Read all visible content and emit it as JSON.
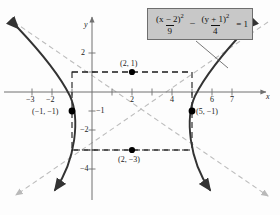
{
  "figure": {
    "background": "#fdfdfd"
  },
  "equation": {
    "numerator_x": "(x − 2)²",
    "denominator_x": "9",
    "operator": "−",
    "numerator_y": "(y + 1)²",
    "denominator_y": "4",
    "rhs": "= 1",
    "box_fill": "#c8c8c8",
    "box_border": "#6e6e6e"
  },
  "axes": {
    "x_label": "x",
    "y_label": "y",
    "x_ticks": [
      {
        "value": -3,
        "label": "−3"
      },
      {
        "value": -2,
        "label": "−2"
      },
      {
        "value": -1,
        "label": ""
      },
      {
        "value": 1,
        "label": ""
      },
      {
        "value": 2,
        "label": "2"
      },
      {
        "value": 3,
        "label": ""
      },
      {
        "value": 4,
        "label": "4"
      },
      {
        "value": 5,
        "label": ""
      },
      {
        "value": 6,
        "label": "6"
      },
      {
        "value": 7,
        "label": "7"
      }
    ],
    "y_ticks": [
      {
        "value": 2,
        "label": "2"
      },
      {
        "value": 1,
        "label": ""
      },
      {
        "value": -1,
        "label": "−1"
      },
      {
        "value": -2,
        "label": "−2"
      },
      {
        "value": -3,
        "label": ""
      },
      {
        "value": -4,
        "label": "−4"
      }
    ],
    "x_range": [
      -4,
      8
    ],
    "y_range": [
      -5,
      3
    ]
  },
  "points": [
    {
      "name": "top-co-vertex",
      "label": "(2, 1)",
      "x": 2,
      "y": 1
    },
    {
      "name": "left-vertex",
      "label": "(−1, −1)",
      "x": -1,
      "y": -1
    },
    {
      "name": "right-vertex",
      "label": "(5, −1)",
      "x": 5,
      "y": -1
    },
    {
      "name": "bottom-co-vertex",
      "label": "(2, −3)",
      "x": 2,
      "y": -3
    }
  ],
  "chart_data": {
    "type": "line",
    "xlabel": "x",
    "ylabel": "y",
    "xlim": [
      -4,
      8
    ],
    "ylim": [
      -5,
      3
    ],
    "grid": false,
    "center": [
      2,
      -1
    ],
    "a": 3,
    "b": 2,
    "vertices": [
      [
        -1,
        -1
      ],
      [
        5,
        -1
      ]
    ],
    "co_vertices": [
      [
        2,
        1
      ],
      [
        2,
        -3
      ]
    ],
    "asymptotes": [
      {
        "name": "positive-slope",
        "slope": 0.6667,
        "intercept": -2.3333,
        "equation": "y + 1 = (2/3)(x − 2)"
      },
      {
        "name": "negative-slope",
        "slope": -0.6667,
        "intercept": 0.3333,
        "equation": "y + 1 = −(2/3)(x − 2)"
      }
    ],
    "reference_rectangle": {
      "x_min": -1,
      "x_max": 5,
      "y_min": -3,
      "y_max": 1
    },
    "series": [
      {
        "name": "left-branch",
        "style": "solid",
        "color": "#333333"
      },
      {
        "name": "right-branch",
        "style": "solid",
        "color": "#333333"
      },
      {
        "name": "asymptote-lines",
        "style": "dashed",
        "color": "#b9b9b9"
      },
      {
        "name": "reference-box",
        "style": "dashed",
        "color": "#1a1a1a"
      }
    ]
  },
  "colors": {
    "curve": "#333333",
    "axis": "#707070",
    "asymptote": "#bdbdbd",
    "dashed_box": "#1a1a1a",
    "point": "#000000",
    "leader": "#555555"
  }
}
